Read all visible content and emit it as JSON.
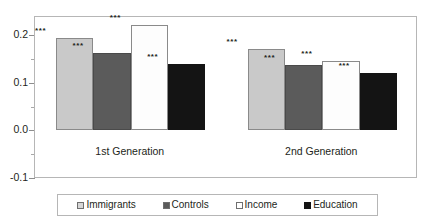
{
  "chart_data": {
    "type": "bar",
    "title": "",
    "subtitle": "",
    "xlabel": "",
    "ylabel": "",
    "categories": [
      "1st Generation",
      "2nd Generation"
    ],
    "series": [
      {
        "name": "Immigrants",
        "color": "#c9c9c9",
        "values": [
          0.193,
          0.17
        ],
        "annotations": [
          "***",
          "***"
        ]
      },
      {
        "name": "Controls",
        "color": "#5b5b5b",
        "values": [
          0.162,
          0.137
        ],
        "annotations": [
          "***",
          "***"
        ]
      },
      {
        "name": "Income",
        "color": "#fdfdfd",
        "values": [
          0.222,
          0.145
        ],
        "annotations": [
          "***",
          "***"
        ]
      },
      {
        "name": "Education",
        "color": "#141414",
        "values": [
          0.14,
          0.12
        ],
        "annotations": [
          "***",
          "***"
        ]
      }
    ],
    "ylim": [
      -0.1,
      0.24
    ],
    "ytick_labels": [
      "0.2",
      "0.1",
      "0.0",
      "-0.1"
    ],
    "ytick_values": [
      0.2,
      0.1,
      0.0,
      -0.1
    ],
    "yminor_values": [
      0.15,
      0.05,
      -0.05
    ],
    "grid": true,
    "legend_position": "bottom"
  },
  "legend": {
    "items": [
      {
        "label": "Immigrants",
        "marker": "square-light"
      },
      {
        "label": "Controls",
        "marker": "square-dark"
      },
      {
        "label": "Income",
        "marker": "square-white"
      },
      {
        "label": "Education",
        "marker": "square-black"
      }
    ]
  }
}
